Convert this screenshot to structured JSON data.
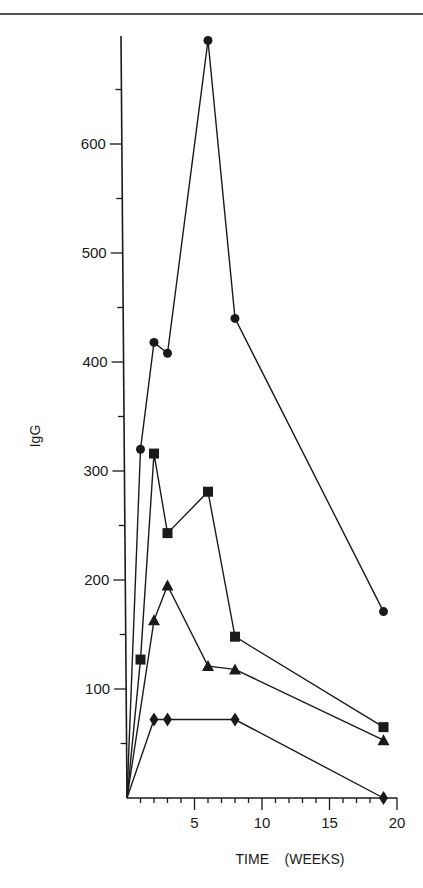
{
  "chart_data": {
    "type": "line",
    "title": "",
    "xlabel": "TIME    (WEEKS)",
    "ylabel": "IgG",
    "xlim": [
      0,
      20
    ],
    "ylim": [
      0,
      700
    ],
    "x_ticks": [
      5,
      10,
      15,
      20
    ],
    "x_minor_step": 1,
    "y_ticks": [
      100,
      200,
      300,
      400,
      500,
      600
    ],
    "y_minor_step": 50,
    "grid": false,
    "legend": null,
    "series": [
      {
        "name": "circle",
        "marker": "circle",
        "x": [
          0,
          1,
          2,
          3,
          6,
          8,
          19
        ],
        "values": [
          0,
          320,
          418,
          408,
          695,
          440,
          171
        ]
      },
      {
        "name": "square",
        "marker": "square",
        "x": [
          0,
          1,
          2,
          3,
          6,
          8,
          19
        ],
        "values": [
          0,
          127,
          316,
          243,
          281,
          148,
          65
        ]
      },
      {
        "name": "triangle",
        "marker": "triangle",
        "x": [
          0,
          2,
          3,
          6,
          8,
          19
        ],
        "values": [
          0,
          163,
          195,
          121,
          118,
          53
        ]
      },
      {
        "name": "diamond",
        "marker": "diamond",
        "x": [
          0,
          2,
          3,
          8,
          19
        ],
        "values": [
          0,
          72,
          72,
          72,
          0
        ]
      }
    ]
  },
  "axes": {
    "x_label": "TIME    (WEEKS)",
    "y_label": "IgG"
  },
  "colors": {
    "ink": "#1a1a1a",
    "background": "#ffffff"
  }
}
